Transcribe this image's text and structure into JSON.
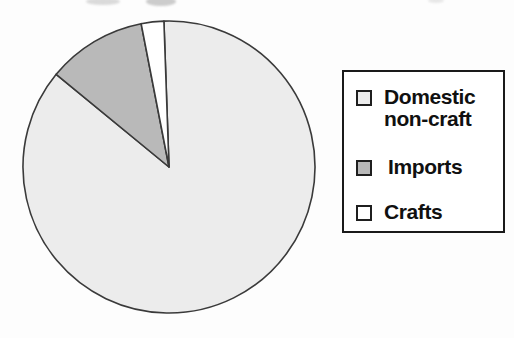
{
  "chart_data": {
    "type": "pie",
    "title": "",
    "slices": [
      {
        "label": "Domestic non-craft",
        "value_pct": 86.5,
        "color": "#ececec"
      },
      {
        "label": "Imports",
        "value_pct": 11.0,
        "color": "#b9b9b9"
      },
      {
        "label": "Crafts",
        "value_pct": 2.5,
        "color": "#ffffff"
      }
    ],
    "start_angle_deg": -2,
    "direction": "clockwise",
    "legend_position": "right"
  },
  "legend": {
    "items": [
      {
        "label": "Domestic\nnon-craft",
        "swatch_color": "#ececec"
      },
      {
        "label": "Imports",
        "swatch_color": "#b9b9b9"
      },
      {
        "label": "Crafts",
        "swatch_color": "#ffffff"
      }
    ]
  },
  "colors": {
    "outline": "#3a3a3a",
    "legend_border": "#1a1a1a",
    "text": "#101010",
    "background": "#fdfdfd"
  }
}
